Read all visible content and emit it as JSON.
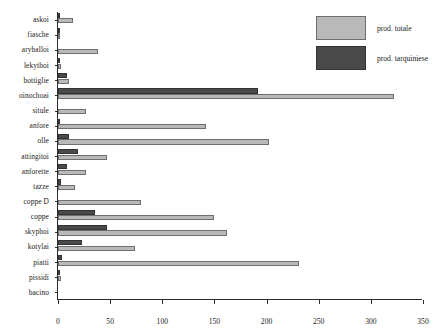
{
  "chart_data": {
    "type": "bar",
    "orientation": "horizontal",
    "title": "",
    "xlabel": "",
    "ylabel": "",
    "xlim": [
      0,
      350
    ],
    "xticks": [
      0,
      50,
      100,
      150,
      200,
      250,
      300,
      350
    ],
    "grid": false,
    "legend_position": "top-right",
    "categories": [
      "askoi",
      "fiasche",
      "aryballoi",
      "lekythoi",
      "bottiglie",
      "oinochoai",
      "situle",
      "anfore",
      "olle",
      "attingitoi",
      "anforette",
      "tazze",
      "coppe D",
      "coppe",
      "skyphoi",
      "kotylai",
      "piatti",
      "pissidi",
      "bacino"
    ],
    "series": [
      {
        "name": "prod. totale",
        "color": "#b9b9b9",
        "values": [
          14,
          2,
          38,
          3,
          11,
          322,
          27,
          142,
          202,
          47,
          27,
          16,
          80,
          150,
          162,
          74,
          231,
          3,
          0
        ]
      },
      {
        "name": "prod. tarquiniese",
        "color": "#4a4a4a",
        "values": [
          2,
          1,
          0,
          2,
          9,
          192,
          0,
          1,
          11,
          19,
          9,
          3,
          0,
          35,
          47,
          23,
          4,
          2,
          0
        ]
      }
    ]
  },
  "legend": {
    "items": [
      {
        "label": "prod. totale",
        "color": "#b9b9b9"
      },
      {
        "label": "prod. tarquiniese",
        "color": "#4a4a4a"
      }
    ]
  }
}
